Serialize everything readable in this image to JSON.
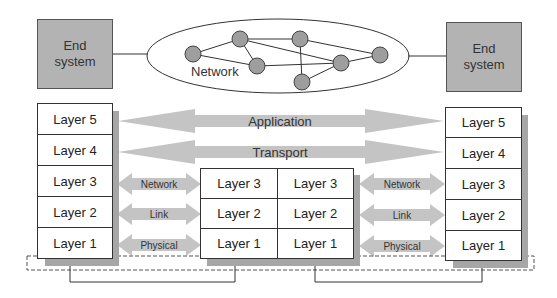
{
  "diagram": {
    "type": "layered-network-model",
    "top": {
      "left_end_system": {
        "line1": "End",
        "line2": "system"
      },
      "right_end_system": {
        "line1": "End",
        "line2": "system"
      },
      "network_label": "Network",
      "network_nodes": 7
    },
    "left_stack": {
      "layers": [
        "Layer 5",
        "Layer 4",
        "Layer 3",
        "Layer 2",
        "Layer 1"
      ]
    },
    "middle_stack": {
      "left_column": [
        "Layer 3",
        "Layer 2",
        "Layer 1"
      ],
      "right_column": [
        "Layer 3",
        "Layer 2",
        "Layer 1"
      ]
    },
    "right_stack": {
      "layers": [
        "Layer 5",
        "Layer 4",
        "Layer 3",
        "Layer 2",
        "Layer 1"
      ]
    },
    "long_arrows": [
      {
        "label": "Application"
      },
      {
        "label": "Transport"
      }
    ],
    "short_arrows_left": [
      {
        "label": "Network"
      },
      {
        "label": "Link"
      },
      {
        "label": "Physical"
      }
    ],
    "short_arrows_right": [
      {
        "label": "Network"
      },
      {
        "label": "Link"
      },
      {
        "label": "Physical"
      }
    ],
    "colors": {
      "end_system_fill": "#b3b3b3",
      "arrow_fill": "#c4c4c4",
      "node_fill": "#9e9e9e",
      "shadow": "#a6a6a6",
      "line": "#333333"
    }
  }
}
